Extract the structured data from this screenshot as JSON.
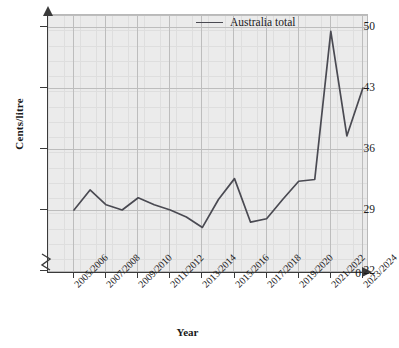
{
  "chart_data": {
    "type": "line",
    "title": "",
    "xlabel": "Year",
    "ylabel": "Cents/litre",
    "ylim": [
      22,
      50
    ],
    "y_axis_break": true,
    "y_ticks": [
      0,
      22,
      29,
      36,
      43,
      50
    ],
    "grid": true,
    "legend_position": "top-right",
    "categories": [
      "2005/2006",
      "2006/2007",
      "2007/2008",
      "2008/2009",
      "2009/2010",
      "2010/2011",
      "2011/2012",
      "2012/2013",
      "2013/2014",
      "2014/2015",
      "2015/2016",
      "2016/2017",
      "2017/2018",
      "2018/2019",
      "2019/2020",
      "2020/2021",
      "2021/2022",
      "2022/2023",
      "2023/2024"
    ],
    "x_tick_labels": [
      "2005/2006",
      "2007/2008",
      "2009/2010",
      "2011/2012",
      "2013/2014",
      "2015/2016",
      "2017/2018",
      "2019/2020",
      "2021/2022",
      "2023/2024"
    ],
    "series": [
      {
        "name": "Australia total",
        "color": "#4a4a52",
        "values": [
          29.0,
          31.3,
          29.6,
          29.0,
          30.4,
          29.6,
          29.0,
          28.2,
          27.0,
          30.2,
          32.6,
          27.6,
          28.0,
          30.2,
          32.3,
          32.5,
          49.5,
          37.5,
          43.0
        ]
      }
    ]
  },
  "legend": {
    "entries": [
      {
        "label": "Australia total"
      }
    ]
  },
  "axis": {
    "y_title": "Cents/litre",
    "x_title": "Year",
    "y_tick_labels": [
      "50",
      "43",
      "36",
      "29",
      "22",
      "0"
    ]
  }
}
